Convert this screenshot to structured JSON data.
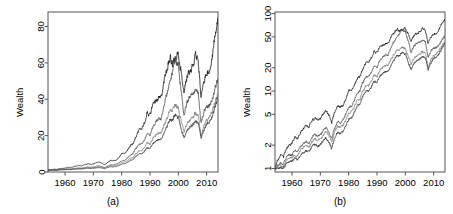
{
  "figure": {
    "background": "#ffffff",
    "panel_count": 2
  },
  "chart_data": [
    {
      "type": "line",
      "panel": "a",
      "caption": "(a)",
      "title": "",
      "xlabel": "",
      "ylabel": "Wealth",
      "yscale": "linear",
      "xlim": [
        1954,
        2014
      ],
      "ylim": [
        0,
        88
      ],
      "grid": false,
      "legend_position": "none",
      "xticks": [
        1960,
        1970,
        1980,
        1990,
        2000,
        2010
      ],
      "xticklabels": [
        "1960",
        "1970",
        "1980",
        "1990",
        "2000",
        "2010"
      ],
      "yticks": [
        0,
        20,
        40,
        60,
        80
      ],
      "yticklabels": [
        "0",
        "20",
        "40",
        "60",
        "80"
      ],
      "x": [
        1954,
        1955,
        1956,
        1957,
        1958,
        1959,
        1960,
        1961,
        1962,
        1963,
        1964,
        1965,
        1966,
        1967,
        1968,
        1969,
        1970,
        1971,
        1972,
        1973,
        1974,
        1975,
        1976,
        1977,
        1978,
        1979,
        1980,
        1981,
        1982,
        1983,
        1984,
        1985,
        1986,
        1987,
        1988,
        1989,
        1990,
        1991,
        1992,
        1993,
        1994,
        1995,
        1996,
        1997,
        1998,
        1999,
        2000,
        2001,
        2002,
        2003,
        2004,
        2005,
        2006,
        2007,
        2008,
        2009,
        2010,
        2011,
        2012,
        2013,
        2014
      ],
      "series": [
        {
          "name": "series-1",
          "color": "#1a1a1a",
          "values": [
            1.0,
            1.3,
            1.5,
            1.4,
            1.8,
            2.0,
            2.1,
            2.5,
            2.4,
            2.9,
            3.3,
            3.6,
            3.4,
            4.1,
            4.5,
            4.2,
            4.4,
            5.0,
            5.6,
            5.0,
            3.9,
            5.2,
            6.4,
            6.2,
            6.6,
            7.8,
            10.2,
            10.0,
            11.8,
            14.4,
            15.2,
            19.5,
            22.8,
            23.5,
            26.5,
            32.5,
            30.5,
            37.5,
            39.0,
            41.5,
            41.0,
            50.5,
            56.0,
            63.5,
            60.0,
            62.0,
            64.5,
            55.0,
            44.0,
            52.0,
            56.0,
            58.0,
            64.5,
            62.0,
            40.0,
            49.0,
            55.0,
            56.0,
            63.0,
            78.0,
            85.0
          ]
        },
        {
          "name": "series-2",
          "color": "#4d4d4d",
          "values": [
            1.0,
            1.1,
            1.2,
            1.1,
            1.4,
            1.5,
            1.5,
            1.7,
            1.6,
            1.9,
            2.1,
            2.2,
            2.1,
            2.5,
            2.8,
            2.6,
            2.7,
            3.1,
            3.4,
            3.0,
            2.4,
            3.2,
            4.0,
            3.9,
            4.2,
            5.0,
            6.2,
            6.4,
            7.6,
            9.4,
            10.0,
            12.8,
            15.0,
            15.5,
            17.5,
            21.5,
            20.5,
            25.0,
            27.0,
            29.0,
            29.5,
            37.0,
            43.0,
            51.0,
            55.0,
            62.0,
            58.0,
            44.0,
            32.0,
            38.0,
            41.0,
            43.0,
            46.0,
            44.0,
            27.0,
            33.0,
            36.0,
            36.5,
            40.0,
            46.0,
            51.0
          ]
        },
        {
          "name": "series-3",
          "color": "#808080",
          "values": [
            1.0,
            1.05,
            1.1,
            1.05,
            1.25,
            1.35,
            1.4,
            1.5,
            1.45,
            1.7,
            1.85,
            1.95,
            1.9,
            2.2,
            2.4,
            2.3,
            2.4,
            2.7,
            3.0,
            2.7,
            2.2,
            2.9,
            3.5,
            3.4,
            3.6,
            4.2,
            5.2,
            5.4,
            6.3,
            7.6,
            8.0,
            10.0,
            11.5,
            11.8,
            13.2,
            16.0,
            15.5,
            18.5,
            20.0,
            21.5,
            21.5,
            26.0,
            29.5,
            33.5,
            34.0,
            37.0,
            35.0,
            28.0,
            22.0,
            26.0,
            28.5,
            30.0,
            32.5,
            31.5,
            20.0,
            25.0,
            28.5,
            29.5,
            33.5,
            39.0,
            43.0
          ]
        },
        {
          "name": "series-4",
          "color": "#333333",
          "values": [
            1.0,
            1.0,
            1.05,
            1.0,
            1.15,
            1.2,
            1.25,
            1.35,
            1.3,
            1.5,
            1.6,
            1.7,
            1.65,
            1.9,
            2.05,
            1.95,
            2.0,
            2.25,
            2.5,
            2.2,
            1.8,
            2.4,
            2.9,
            2.85,
            3.0,
            3.5,
            4.3,
            4.5,
            5.3,
            6.4,
            6.8,
            8.5,
            9.8,
            10.0,
            11.2,
            13.5,
            13.0,
            15.5,
            16.8,
            18.0,
            18.2,
            22.0,
            25.0,
            28.5,
            29.0,
            31.5,
            30.0,
            24.0,
            19.0,
            22.5,
            24.5,
            26.0,
            28.0,
            27.5,
            18.5,
            23.0,
            26.5,
            27.5,
            31.0,
            36.0,
            41.0
          ]
        }
      ]
    },
    {
      "type": "line",
      "panel": "b",
      "caption": "(b)",
      "title": "",
      "xlabel": "",
      "ylabel": "Wealth",
      "yscale": "log",
      "xlim": [
        1954,
        2014
      ],
      "ylim": [
        0.9,
        105
      ],
      "grid": false,
      "legend_position": "none",
      "xticks": [
        1960,
        1970,
        1980,
        1990,
        2000,
        2010
      ],
      "xticklabels": [
        "1960",
        "1970",
        "1980",
        "1990",
        "2000",
        "2010"
      ],
      "yticks": [
        1,
        2,
        5,
        10,
        20,
        50,
        100
      ],
      "yticklabels": [
        "1",
        "2",
        "5",
        "10",
        "20",
        "50",
        "100"
      ],
      "x": [
        1954,
        1955,
        1956,
        1957,
        1958,
        1959,
        1960,
        1961,
        1962,
        1963,
        1964,
        1965,
        1966,
        1967,
        1968,
        1969,
        1970,
        1971,
        1972,
        1973,
        1974,
        1975,
        1976,
        1977,
        1978,
        1979,
        1980,
        1981,
        1982,
        1983,
        1984,
        1985,
        1986,
        1987,
        1988,
        1989,
        1990,
        1991,
        1992,
        1993,
        1994,
        1995,
        1996,
        1997,
        1998,
        1999,
        2000,
        2001,
        2002,
        2003,
        2004,
        2005,
        2006,
        2007,
        2008,
        2009,
        2010,
        2011,
        2012,
        2013,
        2014
      ],
      "series": [
        {
          "name": "series-1",
          "color": "#1a1a1a",
          "values": [
            1.0,
            1.3,
            1.5,
            1.4,
            1.8,
            2.0,
            2.1,
            2.5,
            2.4,
            2.9,
            3.3,
            3.6,
            3.4,
            4.1,
            4.5,
            4.2,
            4.4,
            5.0,
            5.6,
            5.0,
            3.9,
            5.2,
            6.4,
            6.2,
            6.6,
            7.8,
            10.2,
            10.0,
            11.8,
            14.4,
            15.2,
            19.5,
            22.8,
            23.5,
            26.5,
            32.5,
            30.5,
            37.5,
            39.0,
            41.5,
            41.0,
            50.5,
            56.0,
            63.5,
            60.0,
            62.0,
            64.5,
            55.0,
            44.0,
            52.0,
            56.0,
            58.0,
            64.5,
            62.0,
            40.0,
            49.0,
            55.0,
            56.0,
            63.0,
            78.0,
            85.0
          ]
        },
        {
          "name": "series-2",
          "color": "#4d4d4d",
          "values": [
            1.0,
            1.1,
            1.2,
            1.1,
            1.4,
            1.5,
            1.5,
            1.7,
            1.6,
            1.9,
            2.1,
            2.2,
            2.1,
            2.5,
            2.8,
            2.6,
            2.7,
            3.1,
            3.4,
            3.0,
            2.4,
            3.2,
            4.0,
            3.9,
            4.2,
            5.0,
            6.2,
            6.4,
            7.6,
            9.4,
            10.0,
            12.8,
            15.0,
            15.5,
            17.5,
            21.5,
            20.5,
            25.0,
            27.0,
            29.0,
            29.5,
            37.0,
            43.0,
            51.0,
            55.0,
            62.0,
            58.0,
            44.0,
            32.0,
            38.0,
            41.0,
            43.0,
            46.0,
            44.0,
            27.0,
            33.0,
            36.0,
            36.5,
            40.0,
            46.0,
            51.0
          ]
        },
        {
          "name": "series-3",
          "color": "#808080",
          "values": [
            1.0,
            1.05,
            1.1,
            1.05,
            1.25,
            1.35,
            1.4,
            1.5,
            1.45,
            1.7,
            1.85,
            1.95,
            1.9,
            2.2,
            2.4,
            2.3,
            2.4,
            2.7,
            3.0,
            2.7,
            2.2,
            2.9,
            3.5,
            3.4,
            3.6,
            4.2,
            5.2,
            5.4,
            6.3,
            7.6,
            8.0,
            10.0,
            11.5,
            11.8,
            13.2,
            16.0,
            15.5,
            18.5,
            20.0,
            21.5,
            21.5,
            26.0,
            29.5,
            33.5,
            34.0,
            37.0,
            35.0,
            28.0,
            22.0,
            26.0,
            28.5,
            30.0,
            32.5,
            31.5,
            20.0,
            25.0,
            28.5,
            29.5,
            33.5,
            39.0,
            43.0
          ]
        },
        {
          "name": "series-4",
          "color": "#333333",
          "values": [
            1.0,
            1.0,
            1.05,
            1.0,
            1.15,
            1.2,
            1.25,
            1.35,
            1.3,
            1.5,
            1.6,
            1.7,
            1.65,
            1.9,
            2.05,
            1.95,
            2.0,
            2.25,
            2.5,
            2.2,
            1.8,
            2.4,
            2.9,
            2.85,
            3.0,
            3.5,
            4.3,
            4.5,
            5.3,
            6.4,
            6.8,
            8.5,
            9.8,
            10.0,
            11.2,
            13.5,
            13.0,
            15.5,
            16.8,
            18.0,
            18.2,
            22.0,
            25.0,
            28.5,
            29.0,
            31.5,
            30.0,
            24.0,
            19.0,
            22.5,
            24.5,
            26.0,
            28.0,
            27.5,
            18.5,
            23.0,
            26.5,
            27.5,
            31.0,
            36.0,
            41.0
          ]
        }
      ]
    }
  ]
}
